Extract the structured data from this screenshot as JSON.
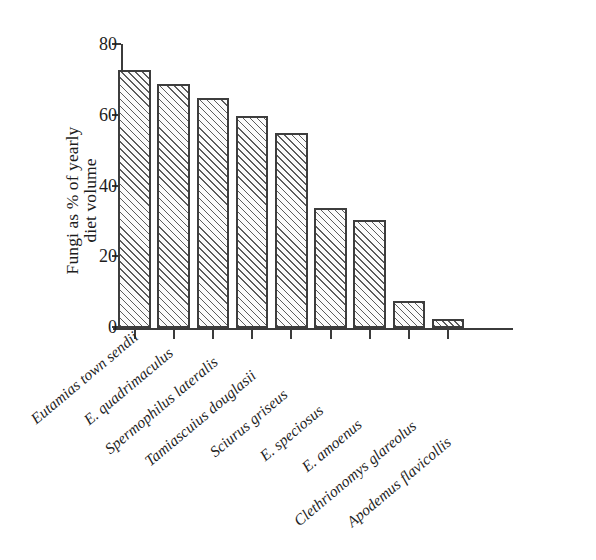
{
  "chart_data": {
    "type": "bar",
    "title": "",
    "subtitle": "",
    "xlabel": "",
    "ylabel": "Fungi as % of yearly diet volume",
    "ylabel_lines": [
      "Fungi as % of yearly",
      "diet volume"
    ],
    "ylim": [
      0,
      80
    ],
    "yticks": [
      0,
      20,
      40,
      60,
      80
    ],
    "ytick_labels": [
      "0",
      "20",
      "40",
      "60",
      "80"
    ],
    "grid": false,
    "legend": false,
    "legend_position": "none",
    "bar_fill": "diagonal-hatch",
    "bar_edge_color": "#3d3d3d",
    "bar_hatch_color": "#5c5c5c",
    "background_color": "#ffffff",
    "categories": [
      "Eutamias town sendii",
      "E. quadrimaculus",
      "Spermophilus lateralis",
      "Tamiascuius douglasii",
      "Sciurus griseus",
      "E. speciosus",
      "E. amoenus",
      "Clethrionomys glareolus",
      "Apodemus flavicollis"
    ],
    "values": [
      73,
      69,
      65,
      60,
      55,
      34,
      30.5,
      7.5,
      2.5
    ],
    "value_unit": "%",
    "annotations": []
  }
}
